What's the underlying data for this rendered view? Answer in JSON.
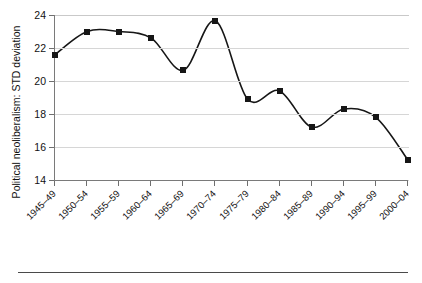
{
  "chart_data": {
    "type": "line",
    "title": "",
    "xlabel": "",
    "ylabel": "Political neoliberalism: STD deviation",
    "categories": [
      "1945–49",
      "1950–54",
      "1955–59",
      "1960–64",
      "1965–69",
      "1970–74",
      "1975–79",
      "1980–84",
      "1985–89",
      "1990–94",
      "1995–99",
      "2000–04"
    ],
    "values": [
      21.6,
      23.0,
      23.0,
      22.6,
      20.65,
      23.65,
      18.9,
      19.4,
      17.2,
      18.3,
      17.8,
      15.2
    ],
    "ylim": [
      14,
      24
    ],
    "yticks": [
      14,
      16,
      18,
      20,
      22,
      24
    ],
    "ytick_labels": [
      "14",
      "16",
      "18",
      "20",
      "22",
      "24"
    ],
    "grid": true,
    "legend": false,
    "marker": "square",
    "line_color": "#161616",
    "marker_color": "#161616",
    "grid_color": "#d6d6d6",
    "axis_color": "#7a7a7a"
  }
}
